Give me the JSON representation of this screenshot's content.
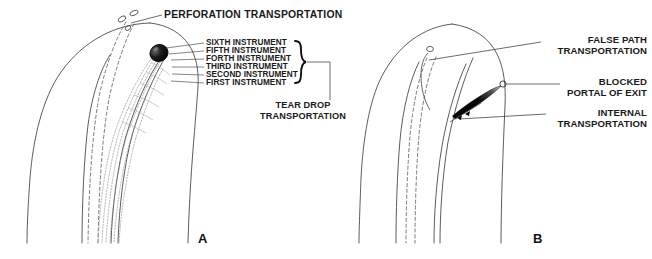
{
  "figure": {
    "background_color": "#ffffff",
    "ink_color": "#1a1a1a",
    "line_color": "#555555",
    "fill_dark": "#000000"
  },
  "panel_a": {
    "letter": "A",
    "title_label": "PERFORATION TRANSPORTATION",
    "bracket_label_line1": "TEAR DROP",
    "bracket_label_line2": "TRANSPORTATION",
    "instruments": [
      {
        "label": "SIXTH INSTRUMENT"
      },
      {
        "label": "FIFTH INSTRUMENT"
      },
      {
        "label": "FORTH INSTRUMENT"
      },
      {
        "label": "THIRD INSTRUMENT"
      },
      {
        "label": "SECOND INSTRUMENT"
      },
      {
        "label": "FIRST INSTRUMENT"
      }
    ]
  },
  "panel_b": {
    "letter": "B",
    "labels": [
      {
        "line1": "FALSE PATH",
        "line2": "TRANSPORTATION"
      },
      {
        "line1": "BLOCKED",
        "line2": "PORTAL OF EXIT"
      },
      {
        "line1": "INTERNAL",
        "line2": "TRANSPORTATION"
      }
    ]
  }
}
